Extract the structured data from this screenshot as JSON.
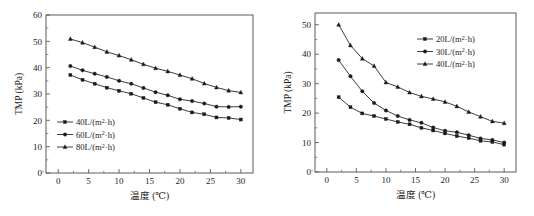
{
  "figure": {
    "panel_count": 2
  },
  "chart_data": [
    {
      "type": "line",
      "panel": "left",
      "title": "",
      "xlabel": "温度 (℃)",
      "ylabel": "TMP (kPa)",
      "xlim": [
        -2,
        32
      ],
      "ylim": [
        0,
        60
      ],
      "xticks": [
        0,
        5,
        10,
        15,
        20,
        25,
        30
      ],
      "yticks": [
        0,
        10,
        20,
        30,
        40,
        50,
        60
      ],
      "xtick_labels": [
        "0",
        "5",
        "10",
        "15",
        "20",
        "25",
        "30"
      ],
      "ytick_labels": [
        "0",
        "10",
        "20",
        "30",
        "40",
        "50",
        "60"
      ],
      "grid": false,
      "legend_position": "lower-left",
      "x": [
        2,
        4,
        6,
        8,
        10,
        12,
        14,
        16,
        18,
        20,
        22,
        24,
        26,
        28,
        30
      ],
      "series": [
        {
          "name": "40L/(m²·h)",
          "label_prefix": "40L/(m",
          "label_sup": "2",
          "label_suffix": "·h)",
          "marker": "square",
          "values": [
            37.2,
            35.4,
            33.9,
            32.4,
            31.2,
            30.1,
            28.5,
            26.9,
            25.9,
            24.4,
            23.0,
            22.3,
            21.1,
            20.9,
            20.3
          ]
        },
        {
          "name": "60L/(m²·h)",
          "label_prefix": "60L/(m",
          "label_sup": "2",
          "label_suffix": "·h)",
          "marker": "circle",
          "values": [
            40.6,
            39.0,
            37.7,
            36.5,
            35.0,
            33.9,
            32.3,
            30.7,
            29.5,
            28.0,
            27.3,
            26.4,
            25.2,
            25.1,
            25.2
          ]
        },
        {
          "name": "80L/(m²·h)",
          "label_prefix": "80L/(m",
          "label_sup": "2",
          "label_suffix": "·h)",
          "marker": "triangle",
          "values": [
            50.9,
            49.5,
            47.8,
            46.0,
            44.6,
            43.0,
            41.3,
            39.8,
            38.6,
            37.2,
            35.8,
            34.0,
            32.5,
            31.3,
            30.6
          ]
        }
      ]
    },
    {
      "type": "line",
      "panel": "right",
      "title": "",
      "xlabel": "温度 (℃)",
      "ylabel": "TMP (kPa)",
      "xlim": [
        -2,
        32
      ],
      "ylim": [
        0,
        54
      ],
      "xticks": [
        0,
        5,
        10,
        15,
        20,
        25,
        30
      ],
      "yticks": [
        0,
        10,
        20,
        30,
        40,
        50
      ],
      "xtick_labels": [
        "0",
        "5",
        "10",
        "15",
        "20",
        "25",
        "30"
      ],
      "ytick_labels": [
        "0",
        "10",
        "20",
        "30",
        "40",
        "50"
      ],
      "grid": false,
      "legend_position": "upper-right",
      "x": [
        2,
        4,
        6,
        8,
        10,
        12,
        14,
        16,
        18,
        20,
        22,
        24,
        26,
        28,
        30
      ],
      "series": [
        {
          "name": "20L/(m²·h)",
          "label_prefix": "20L/(m",
          "label_sup": "2",
          "label_suffix": "·h)",
          "marker": "square",
          "values": [
            25.4,
            22.0,
            19.9,
            19.0,
            18.0,
            17.0,
            16.2,
            15.0,
            14.1,
            13.1,
            12.2,
            11.5,
            10.6,
            10.2,
            9.3
          ]
        },
        {
          "name": "30L/(m²·h)",
          "label_prefix": "30L/(m",
          "label_sup": "2",
          "label_suffix": "·h)",
          "marker": "circle",
          "values": [
            38.0,
            32.5,
            27.4,
            23.4,
            20.9,
            19.0,
            17.7,
            16.7,
            15.1,
            14.0,
            13.5,
            12.5,
            11.4,
            10.9,
            10.0
          ]
        },
        {
          "name": "40L/(m²·h)",
          "label_prefix": "40L/(m",
          "label_sup": "2",
          "label_suffix": "·h)",
          "marker": "triangle",
          "values": [
            50.0,
            43.0,
            38.5,
            36.0,
            30.4,
            28.9,
            27.0,
            25.7,
            24.8,
            23.8,
            22.3,
            20.4,
            18.8,
            17.2,
            16.6
          ]
        }
      ]
    }
  ]
}
